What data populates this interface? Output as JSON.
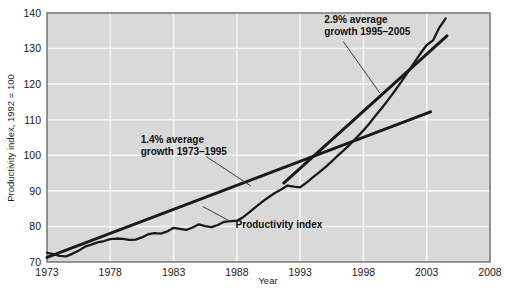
{
  "chart_data": {
    "type": "line",
    "title": "",
    "xlabel": "Year",
    "ylabel": "Productivity index, 1992 = 100",
    "xlim": [
      1973,
      2008
    ],
    "ylim": [
      70,
      140
    ],
    "grid": true,
    "legend_position": "none",
    "x_ticks": [
      "1973",
      "1978",
      "1983",
      "1988",
      "1993",
      "1998",
      "2003",
      "2008"
    ],
    "x_tick_values": [
      1973,
      1978,
      1983,
      1988,
      1993,
      1998,
      2003,
      2008
    ],
    "y_ticks": [
      "70",
      "80",
      "90",
      "100",
      "110",
      "120",
      "130",
      "140"
    ],
    "y_tick_values": [
      70,
      80,
      90,
      100,
      110,
      120,
      130,
      140
    ],
    "series": [
      {
        "name": "Productivity index",
        "style": "line-thick-black-wiggly",
        "x": [
          1973,
          1973.5,
          1974,
          1974.5,
          1975,
          1975.5,
          1976,
          1976.5,
          1977,
          1977.5,
          1978,
          1978.5,
          1979,
          1979.5,
          1980,
          1980.5,
          1981,
          1981.5,
          1982,
          1982.5,
          1983,
          1983.5,
          1984,
          1984.5,
          1985,
          1985.5,
          1986,
          1986.5,
          1987,
          1987.5,
          1988,
          1988.5,
          1989,
          1989.5,
          1990,
          1990.5,
          1991,
          1991.5,
          1992,
          1992.5,
          1993,
          1993.5,
          1994,
          1994.5,
          1995,
          1995.5,
          1996,
          1996.5,
          1997,
          1997.5,
          1998,
          1998.5,
          1999,
          1999.5,
          2000,
          2000.5,
          2001,
          2001.5,
          2002,
          2002.5,
          2003,
          2003.5,
          2004,
          2004.5
        ],
        "y": [
          72.6,
          72.2,
          71.7,
          71.6,
          72.3,
          73.2,
          74.3,
          74.9,
          75.5,
          75.9,
          76.4,
          76.6,
          76.5,
          76.2,
          76.3,
          76.9,
          77.8,
          78.1,
          78.0,
          78.6,
          79.6,
          79.3,
          79.0,
          79.7,
          80.6,
          80.1,
          79.8,
          80.4,
          81.3,
          81.5,
          81.6,
          82.6,
          84.0,
          85.5,
          86.9,
          88.2,
          89.4,
          90.4,
          91.5,
          91.2,
          91.0,
          92.3,
          93.8,
          95.2,
          96.7,
          98.3,
          100.0,
          101.6,
          103.3,
          105.1,
          107.0,
          109.1,
          111.3,
          113.5,
          115.8,
          118.2,
          120.7,
          123.3,
          126.0,
          128.6,
          131.0,
          132.3,
          135.9,
          138.5
        ]
      },
      {
        "name": "1.4% average growth trend 1973-1995",
        "style": "trend-line-straight",
        "x": [
          1973,
          2003.3
        ],
        "y": [
          71.3,
          112.2
        ]
      },
      {
        "name": "2.9% average growth trend 1995-2005",
        "style": "trend-line-straight",
        "x": [
          1991.7,
          2004.6
        ],
        "y": [
          92.2,
          133.6
        ]
      }
    ],
    "annotations": [
      {
        "id": "annot-1-4-percent",
        "lines": [
          "1.4% average",
          "growth 1973–1995"
        ],
        "text_x": 1980.4,
        "text_y": 103.5,
        "leader_from": [
          1985.6,
          99.6
        ],
        "leader_to": [
          1989.1,
          91.4
        ]
      },
      {
        "id": "annot-2-9-percent",
        "lines": [
          "2.9% average",
          "growth 1995–2005"
        ],
        "text_x": 1994.9,
        "text_y": 137.3,
        "leader_from": [
          1996.4,
          132.0
        ],
        "leader_to": [
          1999.3,
          117.5
        ]
      },
      {
        "id": "annot-productivity-index",
        "lines": [
          "Productivity index"
        ],
        "text_x": 1987.9,
        "text_y": 79.5,
        "leader_from": [
          1987.6,
          81.2
        ],
        "leader_to": [
          1985.3,
          85.6
        ]
      }
    ]
  },
  "axes": {
    "x_axis_title": "Year",
    "y_axis_title": "Productivity index, 1992 = 100"
  },
  "colors": {
    "plot_background": "#d9d9d9",
    "gridline": "#f4f4f4",
    "axis_frame": "#6b6b6b",
    "data_line": "#1a1a1a",
    "trend_line": "#1a1a1a",
    "text": "#1a1a1a",
    "figure_background": "#ffffff"
  }
}
